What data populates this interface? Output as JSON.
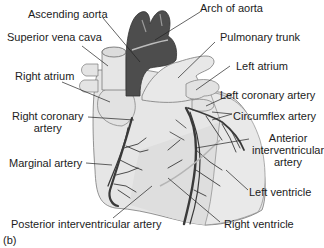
{
  "figure": {
    "panel_label": "(b)",
    "labels": {
      "ascending_aorta": "Ascending aorta",
      "arch_of_aorta": "Arch of aorta",
      "superior_vena_cava": "Superior vena cava",
      "pulmonary_trunk": "Pulmonary trunk",
      "left_atrium": "Left atrium",
      "right_atrium": "Right atrium",
      "left_coronary_artery": "Left coronary artery",
      "right_coronary_artery_line1": "Right coronary",
      "right_coronary_artery_line2": "artery",
      "circumflex_artery": "Circumflex artery",
      "anterior_interventricular_line1": "Anterior",
      "anterior_interventricular_line2": "interventricular",
      "anterior_interventricular_line3": "artery",
      "marginal_artery": "Marginal artery",
      "left_ventricle": "Left ventricle",
      "posterior_interventricular_artery": "Posterior interventricular artery",
      "right_ventricle": "Right ventricle"
    },
    "colors": {
      "aorta": "#4a4a4a",
      "heart_body": "#e4e4e4",
      "vessels": "#3a3a3a",
      "outline": "#6a6a6a",
      "leader_lines": "#222222"
    }
  }
}
